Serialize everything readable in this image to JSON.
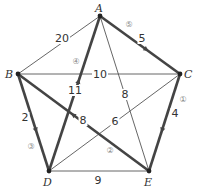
{
  "graph": {
    "vertices": [
      {
        "id": "A",
        "label": "A",
        "x": 100,
        "y": 16,
        "lx": 95,
        "ly": 12
      },
      {
        "id": "B",
        "label": "B",
        "x": 18,
        "y": 74,
        "lx": 5,
        "ly": 78
      },
      {
        "id": "C",
        "label": "C",
        "x": 180,
        "y": 74,
        "lx": 184,
        "ly": 78
      },
      {
        "id": "D",
        "label": "D",
        "x": 49,
        "y": 171,
        "lx": 43,
        "ly": 186
      },
      {
        "id": "E",
        "label": "E",
        "x": 149,
        "y": 171,
        "lx": 144,
        "ly": 186
      }
    ],
    "edges": [
      {
        "from": "A",
        "to": "B",
        "weight": "20",
        "bold": false,
        "wx": 62,
        "wy": 42
      },
      {
        "from": "B",
        "to": "C",
        "weight": "10",
        "bold": false,
        "wx": 100,
        "wy": 78
      },
      {
        "from": "A",
        "to": "E",
        "weight": "8",
        "bold": false,
        "wx": 125,
        "wy": 98
      },
      {
        "from": "C",
        "to": "D",
        "weight": "6",
        "bold": false,
        "wx": 115,
        "wy": 125
      },
      {
        "from": "D",
        "to": "E",
        "weight": "9",
        "bold": false,
        "wx": 98,
        "wy": 184
      },
      {
        "from": "A",
        "to": "C",
        "weight": "5",
        "bold": true,
        "order": "⑤",
        "wx": 142,
        "wy": 42,
        "ox": 129,
        "oy": 27
      },
      {
        "from": "C",
        "to": "E",
        "weight": "4",
        "bold": true,
        "order": "①",
        "wx": 175,
        "wy": 117,
        "ox": 183,
        "oy": 102
      },
      {
        "from": "E",
        "to": "B",
        "weight": "8",
        "bold": true,
        "order": "②",
        "wx": 83,
        "wy": 124,
        "ox": 110,
        "oy": 153
      },
      {
        "from": "B",
        "to": "D",
        "weight": "2",
        "bold": true,
        "order": "③",
        "wx": 25,
        "wy": 121,
        "ox": 31,
        "oy": 149
      },
      {
        "from": "D",
        "to": "A",
        "weight": "11",
        "bold": true,
        "order": "④",
        "wx": 75,
        "wy": 94,
        "ox": 76,
        "oy": 64
      }
    ]
  }
}
